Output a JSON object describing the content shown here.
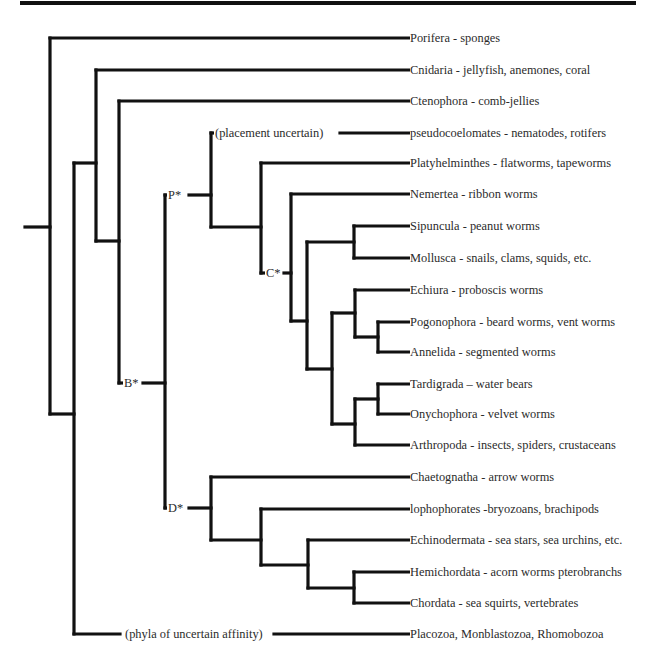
{
  "diagram": {
    "type": "phylogenetic-tree",
    "title": "",
    "leaves": [
      {
        "id": "porifera",
        "label": "Porifera - sponges",
        "y": 38
      },
      {
        "id": "cnidaria",
        "label": "Cnidaria - jellyfish, anemones, coral",
        "y": 70
      },
      {
        "id": "ctenophora",
        "label": "Ctenophora - comb-jellies",
        "y": 101
      },
      {
        "id": "pseudocoelomates",
        "label": "pseudocoelomates - nematodes, rotifers",
        "y": 133
      },
      {
        "id": "platyhelminthes",
        "label": "Platyhelminthes - flatworms, tapeworms",
        "y": 163
      },
      {
        "id": "nemertea",
        "label": "Nemertea - ribbon worms",
        "y": 194
      },
      {
        "id": "sipuncula",
        "label": "Sipuncula - peanut worms",
        "y": 226
      },
      {
        "id": "mollusca",
        "label": "Mollusca - snails, clams, squids, etc.",
        "y": 258
      },
      {
        "id": "echiura",
        "label": "Echiura - proboscis worms",
        "y": 290
      },
      {
        "id": "pogonophora",
        "label": "Pogonophora - beard worms, vent worms",
        "y": 322
      },
      {
        "id": "annelida",
        "label": "Annelida - segmented worms",
        "y": 352
      },
      {
        "id": "tardigrada",
        "label": "Tardigrada – water bears",
        "y": 384
      },
      {
        "id": "onychophora",
        "label": "Onychophora - velvet worms",
        "y": 414
      },
      {
        "id": "arthropoda",
        "label": "Arthropoda - insects, spiders, crustaceans",
        "y": 445
      },
      {
        "id": "chaetognatha",
        "label": "Chaetognatha - arrow worms",
        "y": 477
      },
      {
        "id": "lophophorates",
        "label": "lophophorates -bryozoans, brachipods",
        "y": 509
      },
      {
        "id": "echinodermata",
        "label": "Echinodermata - sea stars, sea urchins, etc.",
        "y": 540
      },
      {
        "id": "hemichordata",
        "label": "Hemichordata - acorn worms pterobranchs",
        "y": 572
      },
      {
        "id": "chordata",
        "label": "Chordata - sea squirts, vertebrates",
        "y": 603
      },
      {
        "id": "uncertain-phyla",
        "label": "Placozoa, Monblastozoa, Rhomobozoa",
        "y": 634
      }
    ],
    "node_labels": {
      "placement_uncertain": "(placement uncertain)",
      "phyla_uncertain_affinity": "(phyla of uncertain affinity)",
      "p": "P*",
      "c": "C*",
      "b": "B*",
      "d": "D*"
    },
    "colors": {
      "line": "#111111",
      "text": "#2b2b2b",
      "background": "#ffffff"
    }
  }
}
